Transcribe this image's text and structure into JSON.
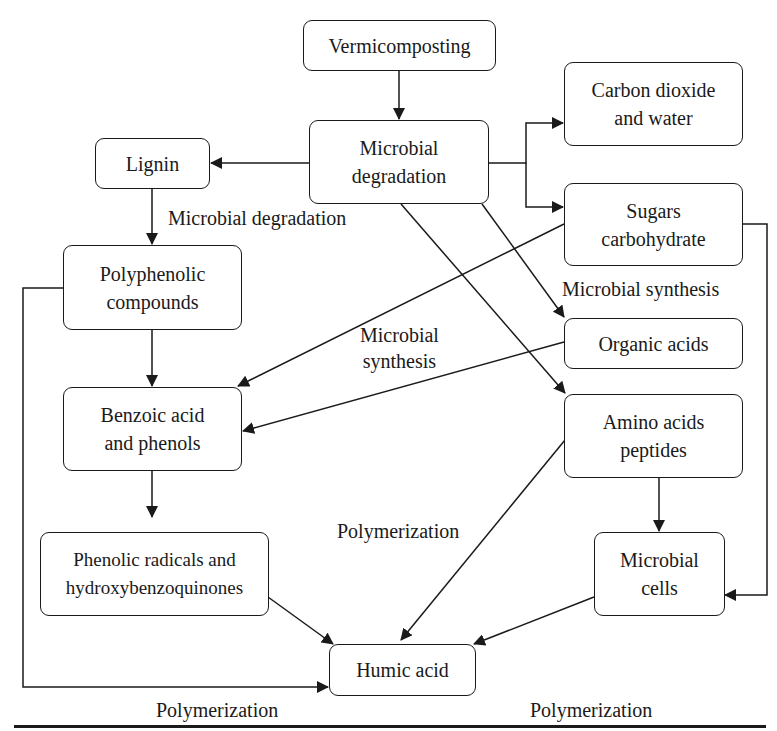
{
  "diagram": {
    "nodes": {
      "vermicomposting": "Vermicomposting",
      "microbial_degradation_1": "Microbial",
      "microbial_degradation_2": "degradation",
      "lignin": "Lignin",
      "co2_1": "Carbon dioxide",
      "co2_2": "and water",
      "sugars_1": "Sugars",
      "sugars_2": "carbohydrate",
      "polyphenolic_1": "Polyphenolic",
      "polyphenolic_2": "compounds",
      "organic_acids": "Organic acids",
      "benzoic_1": "Benzoic acid",
      "benzoic_2": "and phenols",
      "amino_1": "Amino acids",
      "amino_2": "peptides",
      "phenolic_radicals_1": "Phenolic radicals and",
      "phenolic_radicals_2": "hydroxybenzoquinones",
      "microbial_cells_1": "Microbial",
      "microbial_cells_2": "cells",
      "humic_acid": "Humic acid"
    },
    "edge_labels": {
      "lignin_degradation": "Microbial degradation",
      "microbial_synthesis_right": "Microbial synthesis",
      "microbial_synthesis_center_1": "Microbial",
      "microbial_synthesis_center_2": "synthesis",
      "polymerization_center": "Polymerization",
      "polymerization_left": "Polymerization",
      "polymerization_right": "Polymerization"
    },
    "edges": [
      {
        "from": "Vermicomposting",
        "to": "Microbial degradation"
      },
      {
        "from": "Microbial degradation",
        "to": "Lignin"
      },
      {
        "from": "Microbial degradation",
        "to": "Carbon dioxide and water"
      },
      {
        "from": "Microbial degradation",
        "to": "Sugars carbohydrate"
      },
      {
        "from": "Microbial degradation",
        "to": "Organic acids"
      },
      {
        "from": "Microbial degradation",
        "to": "Amino acids peptides"
      },
      {
        "from": "Lignin",
        "to": "Polyphenolic compounds",
        "label": "Microbial degradation"
      },
      {
        "from": "Polyphenolic compounds",
        "to": "Benzoic acid and phenols"
      },
      {
        "from": "Polyphenolic compounds",
        "to": "Humic acid"
      },
      {
        "from": "Sugars carbohydrate",
        "to": "Benzoic acid and phenols",
        "label": "Microbial synthesis"
      },
      {
        "from": "Organic acids",
        "to": "Benzoic acid and phenols",
        "label": "Microbial synthesis"
      },
      {
        "from": "Sugars carbohydrate",
        "to": "Microbial cells"
      },
      {
        "from": "Benzoic acid and phenols",
        "to": "Phenolic radicals and hydroxybenzoquinones"
      },
      {
        "from": "Amino acids peptides",
        "to": "Microbial cells"
      },
      {
        "from": "Phenolic radicals and hydroxybenzoquinones",
        "to": "Humic acid",
        "label": "Polymerization"
      },
      {
        "from": "Amino acids peptides",
        "to": "Humic acid",
        "label": "Polymerization"
      },
      {
        "from": "Microbial cells",
        "to": "Humic acid",
        "label": "Polymerization"
      }
    ]
  }
}
